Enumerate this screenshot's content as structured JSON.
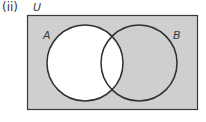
{
  "part_label": "(ii)",
  "universal_label": "U",
  "set_a_label": "A",
  "set_b_label": "B",
  "colors": {
    "shade": "#cfcfcf",
    "unshaded": "#ffffff",
    "stroke": "#2e2e2e"
  },
  "shaded_region": "A' (complement of A)"
}
